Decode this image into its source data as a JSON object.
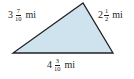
{
  "figure": {
    "type": "triangle",
    "fill_color": "#cfe3ef",
    "stroke_color": "#231f20",
    "vertices": {
      "apex": [
        83,
        3
      ],
      "bottom_left": [
        13,
        53
      ],
      "bottom_right": [
        113,
        53
      ]
    }
  },
  "sides": {
    "left": {
      "whole": "3",
      "numerator": "7",
      "denominator": "10",
      "unit": "mi"
    },
    "right": {
      "whole": "2",
      "numerator": "1",
      "denominator": "2",
      "unit": "mi"
    },
    "bottom": {
      "whole": "4",
      "numerator": "3",
      "denominator": "10",
      "unit": "mi"
    }
  }
}
